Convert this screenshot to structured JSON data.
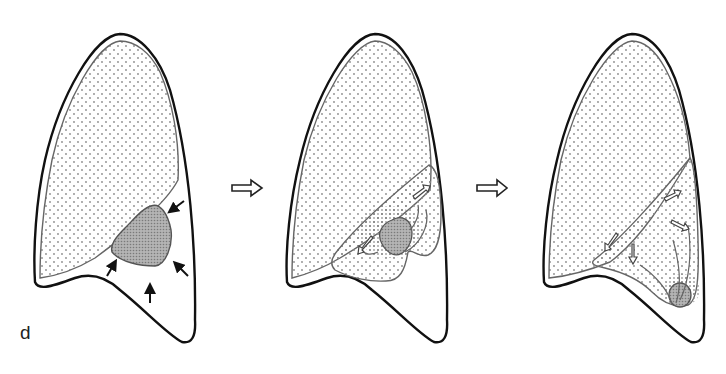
{
  "figure": {
    "panel_label": "d",
    "stages": [
      {
        "name": "stage-1",
        "description": "Lower lobe collapse with compressing arrows toward lesion"
      },
      {
        "name": "stage-2",
        "description": "Lobe shrinking with lesion, outward arrows"
      },
      {
        "name": "stage-3",
        "description": "Lesion retracted to lung base, lobe re-expanded"
      }
    ],
    "transition_arrows": [
      "hollow-right-arrow",
      "hollow-right-arrow"
    ],
    "colors": {
      "outline": "#111111",
      "pleura": "#777777",
      "dot_fill": "#8a8a8a",
      "lesion_fill": "#9a9a9a",
      "background": "#ffffff"
    }
  }
}
